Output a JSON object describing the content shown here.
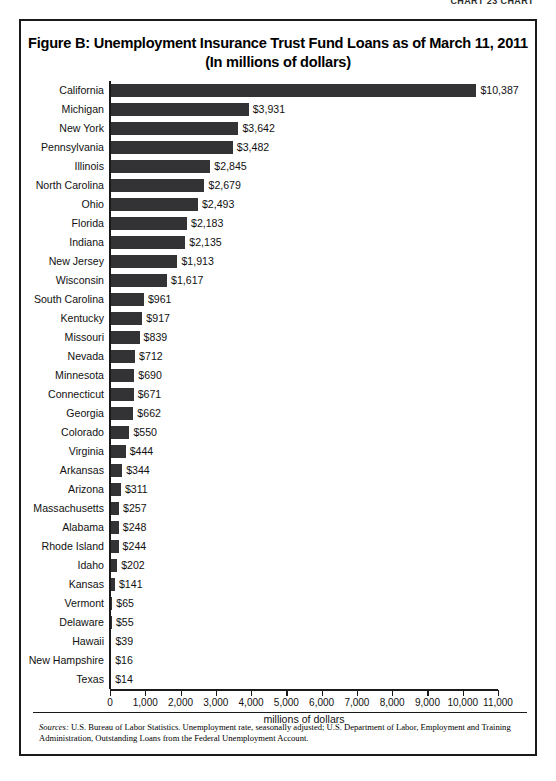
{
  "page_header": {
    "text": "CHART 23 CHART"
  },
  "figure": {
    "title_line1": "Figure B: Unemployment Insurance Trust Fund Loans as of March 11, 2011",
    "title_line2": "(In millions of dollars)"
  },
  "sources": {
    "label": "Sources:",
    "text": " U.S. Bureau of Labor Statistics. Unemployment rate, seasonally adjusted; U.S. Department of Labor, Employment and Training Administration, Outstanding Loans from the Federal Unemployment Account."
  },
  "chart_data": {
    "type": "bar",
    "orientation": "horizontal",
    "title": "Figure B: Unemployment Insurance Trust Fund Loans as of March 11, 2011 (In millions of dollars)",
    "xlabel": "millions of dollars",
    "ylabel": "",
    "xlim": [
      0,
      11000
    ],
    "xticks": [
      0,
      1000,
      2000,
      3000,
      4000,
      5000,
      6000,
      7000,
      8000,
      9000,
      10000,
      11000
    ],
    "xtick_labels": [
      "0",
      "1,000",
      "2,000",
      "3,000",
      "4,000",
      "5,000",
      "6,000",
      "7,000",
      "8,000",
      "9,000",
      "10,000",
      "11,000"
    ],
    "grid": false,
    "legend": false,
    "bar_color": "#333335",
    "categories": [
      "California",
      "Michigan",
      "New York",
      "Pennsylvania",
      "Illinois",
      "North Carolina",
      "Ohio",
      "Florida",
      "Indiana",
      "New Jersey",
      "Wisconsin",
      "South Carolina",
      "Kentucky",
      "Missouri",
      "Nevada",
      "Minnesota",
      "Connecticut",
      "Georgia",
      "Colorado",
      "Virginia",
      "Arkansas",
      "Arizona",
      "Massachusetts",
      "Alabama",
      "Rhode Island",
      "Idaho",
      "Kansas",
      "Vermont",
      "Delaware",
      "Hawaii",
      "New Hampshire",
      "Texas"
    ],
    "values": [
      10387,
      3931,
      3642,
      3482,
      2845,
      2679,
      2493,
      2183,
      2135,
      1913,
      1617,
      961,
      917,
      839,
      712,
      690,
      671,
      662,
      550,
      444,
      344,
      311,
      257,
      248,
      244,
      202,
      141,
      65,
      55,
      39,
      16,
      14
    ],
    "value_labels": [
      "$10,387",
      "$3,931",
      "$3,642",
      "$3,482",
      "$2,845",
      "$2,679",
      "$2,493",
      "$2,183",
      "$2,135",
      "$1,913",
      "$1,617",
      "$961",
      "$917",
      "$839",
      "$712",
      "$690",
      "$671",
      "$662",
      "$550",
      "$444",
      "$344",
      "$311",
      "$257",
      "$248",
      "$244",
      "$202",
      "$141",
      "$65",
      "$55",
      "$39",
      "$16",
      "$14"
    ]
  }
}
